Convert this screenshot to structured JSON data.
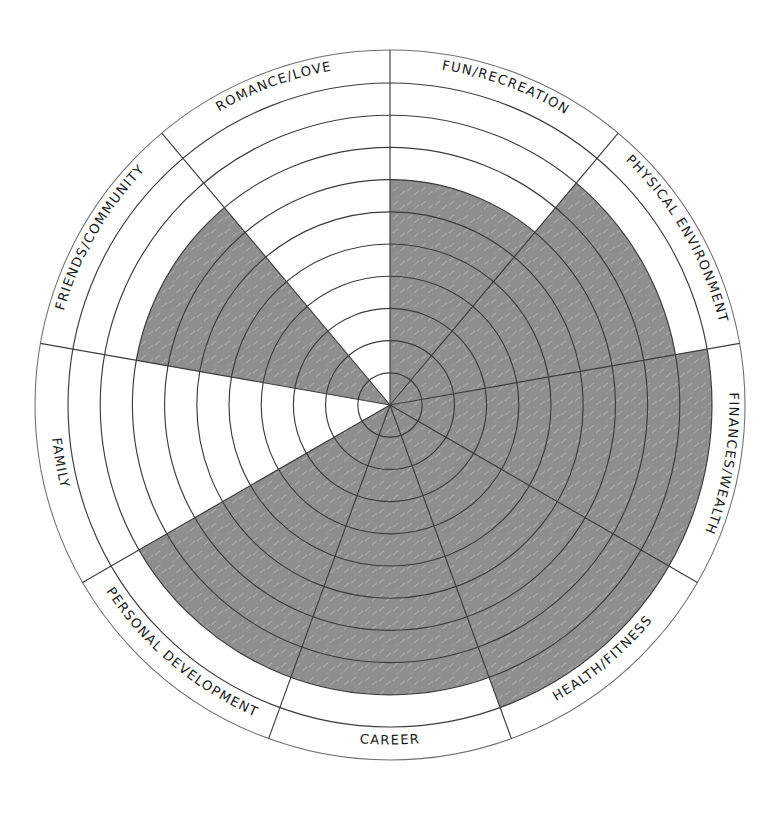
{
  "chart_data": {
    "type": "radar",
    "subtype": "wheel-of-life-polar-segment-chart",
    "scale_min": 0,
    "scale_max": 10,
    "rings": 10,
    "grid": true,
    "legend_position": "none",
    "xlabel": "",
    "ylabel": "",
    "fill_color": "#8c8c8c",
    "line_color": "#3c3c3c",
    "background_color": "#ffffff",
    "categories": [
      "FUN/RECREATION",
      "PHYSICAL ENVIRONMENT",
      "FINANCES/WEALTH",
      "HEALTH/FITNESS",
      "CAREER",
      "PERSONAL DEVELOPMENT",
      "FAMILY",
      "FRIENDS/COMMUNITY",
      "ROMANCE/LOVE"
    ],
    "values": [
      7,
      9,
      10,
      10,
      9,
      9,
      0,
      8,
      0
    ],
    "series": [
      {
        "name": "Current Satisfaction",
        "values": [
          7,
          9,
          10,
          10,
          9,
          9,
          0,
          8,
          0
        ]
      }
    ]
  },
  "wheel": {
    "center_x": 390,
    "center_y": 405,
    "outer_radius": 322,
    "label_radius": 355,
    "start_angle_deg": -90,
    "segments": [
      {
        "id": "fun-recreation",
        "label": "FUN/RECREATION",
        "value": 7,
        "flip": false
      },
      {
        "id": "physical-environment",
        "label": "PHYSICAL ENVIRONMENT",
        "value": 9,
        "flip": false
      },
      {
        "id": "finances-wealth",
        "label": "FINANCES/WEALTH",
        "value": 10,
        "flip": false
      },
      {
        "id": "health-fitness",
        "label": "HEALTH/FITNESS",
        "value": 10,
        "flip": true
      },
      {
        "id": "career",
        "label": "CAREER",
        "value": 9,
        "flip": true
      },
      {
        "id": "personal-development",
        "label": "PERSONAL DEVELOPMENT",
        "value": 9,
        "flip": true
      },
      {
        "id": "family",
        "label": "FAMILY",
        "value": 0,
        "flip": true
      },
      {
        "id": "friends-community",
        "label": "FRIENDS/COMMUNITY",
        "value": 8,
        "flip": false
      },
      {
        "id": "romance-love",
        "label": "ROMANCE/LOVE",
        "value": 0,
        "flip": false
      }
    ]
  }
}
